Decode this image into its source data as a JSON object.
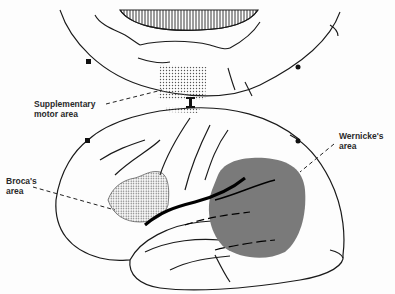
{
  "diagram": {
    "type": "brain-language-areas",
    "views": [
      "medial surface (top)",
      "lateral surface (bottom)"
    ],
    "labels": {
      "supplementary_motor_line1": "Supplementary",
      "supplementary_motor_line2": "motor area",
      "wernicke_line1": "Wernicke's",
      "wernicke_line2": "area",
      "broca_line1": "Broca's",
      "broca_line2": "area"
    },
    "colors": {
      "outline": "#1a1a1a",
      "wernicke_fill": "#7a7a7a",
      "stipple": "#555555",
      "background": "#fdfdfd"
    }
  }
}
